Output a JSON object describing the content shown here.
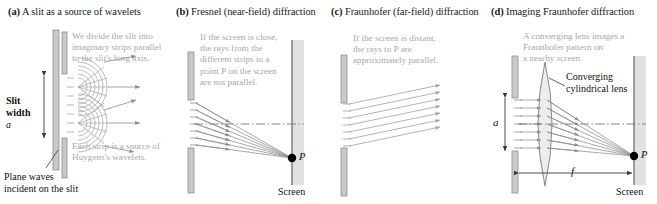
{
  "figure": {
    "panels": [
      {
        "tag": "(a)",
        "title": "A slit as a source of wavelets",
        "annotations": [
          "We divide the slit into\nimaginary strips parallel\nto the slit's long axis.",
          "Each strip is a source of\nHuygens's wavelets."
        ],
        "labels": {
          "slit_width": "Slit\nwidth",
          "slit_width_symbol": "a",
          "plane_waves": "Plane waves\nincident on the slit"
        }
      },
      {
        "tag": "(b)",
        "title": "Fresnel (near-field) diffraction",
        "annotations": [
          "If the screen is close,\nthe rays from the\ndifferent strips to a\npoint P on the screen\nare not parallel."
        ],
        "labels": {
          "point": "P",
          "screen": "Screen"
        }
      },
      {
        "tag": "(c)",
        "title": "Fraunhofer (far-field) diffraction",
        "annotations": [
          "If the screen is distant,\nthe rays to P are\napproximately parallel."
        ],
        "labels": {}
      },
      {
        "tag": "(d)",
        "title": "Imaging Fraunhofer diffraction",
        "annotations": [
          "A converging lens images a\nFraunhofer pattern on\na nearby screen."
        ],
        "labels": {
          "lens": "Converging\ncylindrical lens",
          "aperture_symbol": "a",
          "focal_symbol": "f",
          "point": "P",
          "screen": "Screen"
        }
      }
    ]
  },
  "colors": {
    "barrier": "#c9c9c9",
    "barrier_edge": "#8f8f8f",
    "screen": "#e2e2e2",
    "screen_edge": "#555555",
    "ray": "#8c8c8c",
    "annotation_text": "#a8a8a8",
    "label_text": "#101010",
    "point": "#000000",
    "lens_fill": "#ededed",
    "axis": "#6b6b6b"
  }
}
